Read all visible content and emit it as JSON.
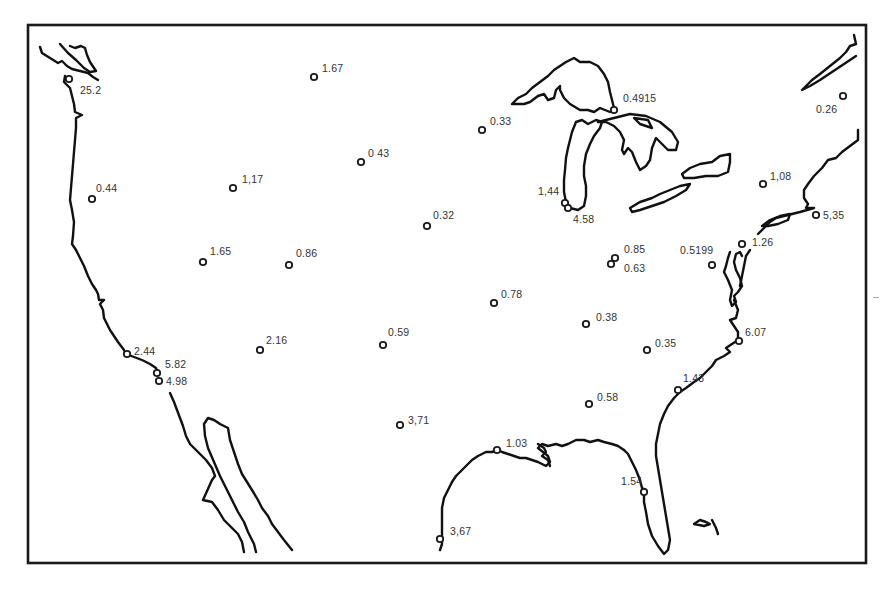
{
  "map": {
    "title": "",
    "region": "Contiguous United States",
    "frame": {
      "x": 28,
      "y": 25,
      "width": 838,
      "height": 538
    },
    "colors": {
      "line": "#111111",
      "label": "#333333",
      "background": "#ffffff"
    },
    "marker_icon": "open-circle-icon",
    "sites": [
      {
        "id": "s1",
        "value": "25.2",
        "x": 69,
        "y": 79,
        "lx": 80,
        "ly": 85
      },
      {
        "id": "s2",
        "value": "1.67",
        "x": 314,
        "y": 77,
        "lx": 322,
        "ly": 63
      },
      {
        "id": "s3",
        "value": "0.4915",
        "x": 614,
        "y": 110,
        "lx": 623,
        "ly": 93
      },
      {
        "id": "s4",
        "value": "0.26",
        "x": 843,
        "y": 96,
        "lx": 816,
        "ly": 104
      },
      {
        "id": "s5",
        "value": "0.33",
        "x": 482,
        "y": 130,
        "lx": 490,
        "ly": 116
      },
      {
        "id": "s6",
        "value": "0 43",
        "x": 361,
        "y": 162,
        "lx": 368,
        "ly": 148
      },
      {
        "id": "s7",
        "value": "1,17",
        "x": 233,
        "y": 188,
        "lx": 242,
        "ly": 174
      },
      {
        "id": "s8",
        "value": "0.44",
        "x": 92,
        "y": 199,
        "lx": 96,
        "ly": 183
      },
      {
        "id": "s9",
        "value": "1,08",
        "x": 763,
        "y": 184,
        "lx": 770,
        "ly": 171
      },
      {
        "id": "s10",
        "value": "1,44",
        "x": 565,
        "y": 203,
        "lx": 538,
        "ly": 186
      },
      {
        "id": "s11",
        "value": "4.58",
        "x": 568,
        "y": 208,
        "lx": 573,
        "ly": 214
      },
      {
        "id": "s12",
        "value": "5,35",
        "x": 816,
        "y": 215,
        "lx": 823,
        "ly": 210
      },
      {
        "id": "s13",
        "value": "0.32",
        "x": 427,
        "y": 226,
        "lx": 433,
        "ly": 210
      },
      {
        "id": "s14",
        "value": "1.26",
        "x": 742,
        "y": 244,
        "lx": 752,
        "ly": 237
      },
      {
        "id": "s15",
        "value": "0.85",
        "x": 615,
        "y": 258,
        "lx": 624,
        "ly": 244
      },
      {
        "id": "s16",
        "value": "0.63",
        "x": 611,
        "y": 264,
        "lx": 624,
        "ly": 263
      },
      {
        "id": "s17",
        "value": "0.5199",
        "x": 712,
        "y": 265,
        "lx": 680,
        "ly": 245
      },
      {
        "id": "s18",
        "value": "1.65",
        "x": 203,
        "y": 262,
        "lx": 210,
        "ly": 246
      },
      {
        "id": "s19",
        "value": "0.86",
        "x": 289,
        "y": 265,
        "lx": 296,
        "ly": 248
      },
      {
        "id": "s20",
        "value": "0.78",
        "x": 494,
        "y": 303,
        "lx": 501,
        "ly": 289
      },
      {
        "id": "s21",
        "value": "0.38",
        "x": 586,
        "y": 324,
        "lx": 596,
        "ly": 312
      },
      {
        "id": "s22",
        "value": "0.35",
        "x": 647,
        "y": 350,
        "lx": 655,
        "ly": 338
      },
      {
        "id": "s23",
        "value": "6.07",
        "x": 739,
        "y": 341,
        "lx": 745,
        "ly": 327
      },
      {
        "id": "s24",
        "value": "0.59",
        "x": 383,
        "y": 345,
        "lx": 388,
        "ly": 327
      },
      {
        "id": "s25",
        "value": "2.16",
        "x": 260,
        "y": 350,
        "lx": 266,
        "ly": 335
      },
      {
        "id": "s26",
        "value": "2.44",
        "x": 127,
        "y": 354,
        "lx": 134,
        "ly": 346
      },
      {
        "id": "s27",
        "value": "5.82",
        "x": 157,
        "y": 373,
        "lx": 165,
        "ly": 359
      },
      {
        "id": "s28",
        "value": "4.98",
        "x": 159,
        "y": 381,
        "lx": 166,
        "ly": 376
      },
      {
        "id": "s29",
        "value": "1.43",
        "x": 678,
        "y": 390,
        "lx": 683,
        "ly": 373
      },
      {
        "id": "s30",
        "value": "0.58",
        "x": 589,
        "y": 404,
        "lx": 597,
        "ly": 392
      },
      {
        "id": "s31",
        "value": "3,71",
        "x": 400,
        "y": 425,
        "lx": 408,
        "ly": 415
      },
      {
        "id": "s32",
        "value": "1.03",
        "x": 497,
        "y": 450,
        "lx": 506,
        "ly": 438
      },
      {
        "id": "s33",
        "value": "1.54",
        "x": 644,
        "y": 492,
        "lx": 621,
        "ly": 476
      },
      {
        "id": "s34",
        "value": "3,67",
        "x": 440,
        "y": 539,
        "lx": 450,
        "ly": 526
      }
    ]
  }
}
